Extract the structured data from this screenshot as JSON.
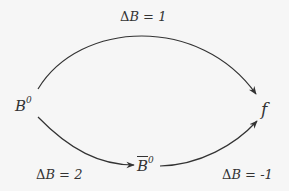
{
  "diagram": {
    "nodes": [
      {
        "id": "B0",
        "base": "B",
        "superscript": "0"
      },
      {
        "id": "f",
        "base": "f"
      },
      {
        "id": "B0bar",
        "base": "B",
        "superscript": "0",
        "overline": true
      }
    ],
    "edges": [
      {
        "from": "B0",
        "to": "f",
        "label_delta": "Δ",
        "label_var": "B",
        "label_eq": " = ",
        "label_value": "1"
      },
      {
        "from": "B0",
        "to": "B0bar",
        "label_delta": "Δ",
        "label_var": "B",
        "label_eq": " = ",
        "label_value": "2"
      },
      {
        "from": "B0bar",
        "to": "f",
        "label_delta": "Δ",
        "label_var": "B",
        "label_eq": " = ",
        "label_value": "-1"
      }
    ],
    "colors": {
      "stroke": "#333333",
      "background": "#f6f6f6"
    }
  }
}
